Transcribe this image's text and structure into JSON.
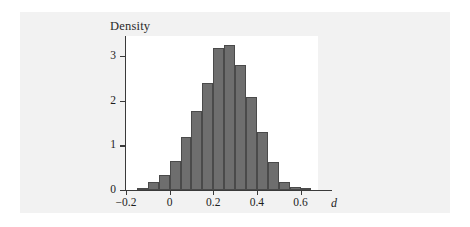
{
  "chart_data": {
    "type": "bar",
    "title": "Density",
    "xlabel": "d",
    "ylabel": "Density",
    "xlim": [
      -0.2,
      0.68
    ],
    "ylim": [
      0,
      3.45
    ],
    "grid": false,
    "legend": null,
    "bin_width": 0.05,
    "bin_edges": [
      -0.15,
      -0.1,
      -0.05,
      0.0,
      0.05,
      0.1,
      0.15,
      0.2,
      0.25,
      0.3,
      0.35,
      0.4,
      0.45,
      0.5,
      0.55,
      0.6,
      0.65
    ],
    "categories": [
      "-0.15",
      "-0.10",
      "-0.05",
      "0.00",
      "0.05",
      "0.10",
      "0.15",
      "0.20",
      "0.25",
      "0.30",
      "0.35",
      "0.40",
      "0.45",
      "0.50",
      "0.55",
      "0.60"
    ],
    "values": [
      0.05,
      0.18,
      0.33,
      0.66,
      1.19,
      1.78,
      2.4,
      3.18,
      3.25,
      2.79,
      2.08,
      1.29,
      0.63,
      0.19,
      0.06,
      0.01
    ],
    "x_ticks": [
      {
        "value": -0.2,
        "label": "−0.2"
      },
      {
        "value": 0.0,
        "label": "0"
      },
      {
        "value": 0.2,
        "label": "0.2"
      },
      {
        "value": 0.4,
        "label": "0.4"
      },
      {
        "value": 0.6,
        "label": "0.6"
      }
    ],
    "y_ticks": [
      {
        "value": 0,
        "label": "0"
      },
      {
        "value": 1,
        "label": "1"
      },
      {
        "value": 2,
        "label": "2"
      },
      {
        "value": 3,
        "label": "3"
      }
    ],
    "colors": {
      "bar_fill": "#6e6e6e",
      "bar_edge": "#4a4a4a",
      "axis": "#3a3a3a",
      "plot_background": "#ffffff",
      "panel_background": "#f2f2f2",
      "text": "#1d1d1d"
    }
  }
}
